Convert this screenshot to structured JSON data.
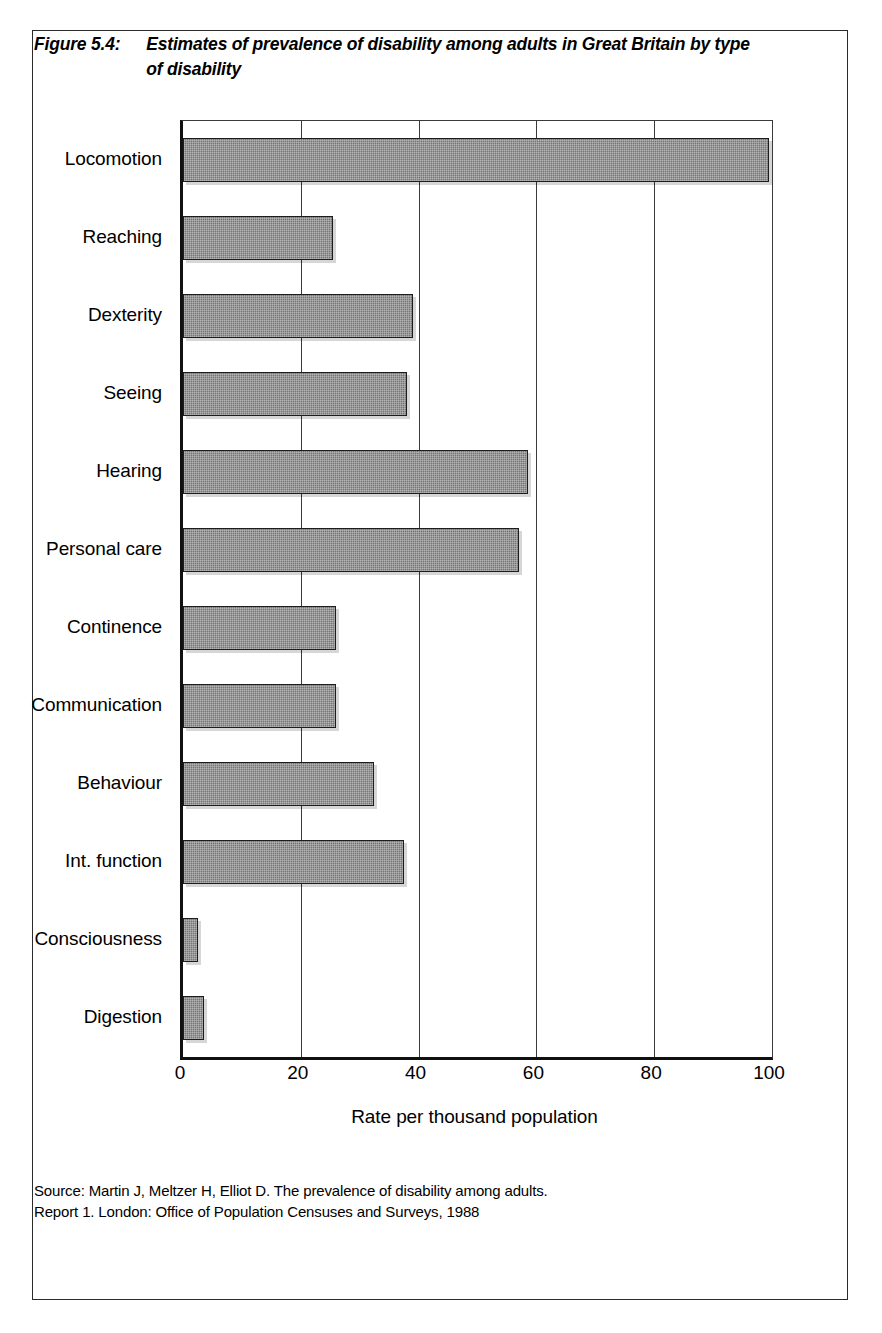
{
  "figure": {
    "number": "Figure 5.4:",
    "title": "Estimates of prevalence of disability among adults in Great Britain by type of disability",
    "source_line_1": "Source: Martin J, Meltzer H, Elliot D. The prevalence of disability among adults.",
    "source_line_2": "Report 1. London: Office of Population Censuses and Surveys, 1988"
  },
  "chart_data": {
    "type": "bar",
    "orientation": "horizontal",
    "title": "Estimates of prevalence of disability among adults in Great Britain by type of disability",
    "xlabel": "Rate per thousand population",
    "ylabel": "",
    "xlim": [
      0,
      100
    ],
    "xticks": [
      0,
      20,
      40,
      60,
      80,
      100
    ],
    "xtick_labels": [
      "0",
      "20",
      "40",
      "60",
      "80",
      "100"
    ],
    "grid": "vertical",
    "legend": "none",
    "bar_color": "#757575",
    "bar_edge_color": "#1d1d1d",
    "categories": [
      "Locomotion",
      "Reaching",
      "Dexterity",
      "Seeing",
      "Hearing",
      "Personal care",
      "Continence",
      "Communication",
      "Behaviour",
      "Int. function",
      "Consciousness",
      "Digestion"
    ],
    "values": [
      99.5,
      25.5,
      39.0,
      38.0,
      58.5,
      57.0,
      26.0,
      26.0,
      32.5,
      37.5,
      2.5,
      3.5
    ]
  }
}
